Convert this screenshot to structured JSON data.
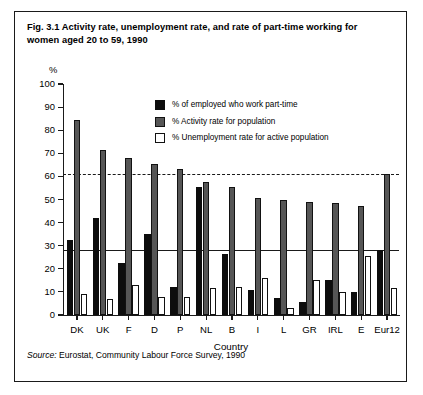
{
  "figure": {
    "caption": "Fig. 3.1  Activity rate, unemployment rate, and rate of part-time working for women aged 20 to 59, 1990",
    "source_label": "Source:",
    "source_text": "Eurostat, Community Labour Force Survey, 1990"
  },
  "legend": {
    "items": [
      {
        "label": "% of employed who work part-time",
        "swatch": "black",
        "color": "#0d0d0d"
      },
      {
        "label": "% Activity rate for population",
        "swatch": "gray",
        "color": "#565656"
      },
      {
        "label": "% Unemployment rate for active population",
        "swatch": "white",
        "color": "#ffffff"
      }
    ]
  },
  "chart_data": {
    "type": "bar",
    "title": "Fig. 3.1  Activity rate, unemployment rate, and rate of part-time working for women aged 20 to 59, 1990",
    "xlabel": "Country",
    "ylabel": "%",
    "ylim": [
      0,
      100
    ],
    "yticks": [
      0,
      10,
      20,
      30,
      40,
      50,
      60,
      70,
      80,
      90,
      100
    ],
    "grid": false,
    "legend_position": "inside-top-center",
    "categories": [
      "DK",
      "UK",
      "F",
      "D",
      "P",
      "NL",
      "B",
      "I",
      "L",
      "GR",
      "IRL",
      "E",
      "Eur12"
    ],
    "series": [
      {
        "name": "% of employed who work part-time",
        "color": "#0d0d0d",
        "values": [
          32.5,
          42.0,
          22.5,
          35.0,
          12.0,
          55.5,
          26.5,
          11.0,
          7.5,
          5.5,
          15.0,
          10.0,
          28.0
        ]
      },
      {
        "name": "% Activity rate for population",
        "color": "#565656",
        "values": [
          84.5,
          71.5,
          68.0,
          65.5,
          63.0,
          57.5,
          55.5,
          50.5,
          50.0,
          49.0,
          48.5,
          47.0,
          61.0
        ]
      },
      {
        "name": "% Unemployment rate for active population",
        "color": "#ffffff",
        "values": [
          9.0,
          7.0,
          13.0,
          8.0,
          8.0,
          11.5,
          12.0,
          16.0,
          3.0,
          15.0,
          10.0,
          25.5,
          11.5
        ]
      }
    ],
    "reference_lines": [
      {
        "name": "eur12-activity-rate",
        "value": 61.0,
        "style": "dashed"
      },
      {
        "name": "eur12-part-time-rate",
        "value": 28.0,
        "style": "solid"
      }
    ]
  }
}
